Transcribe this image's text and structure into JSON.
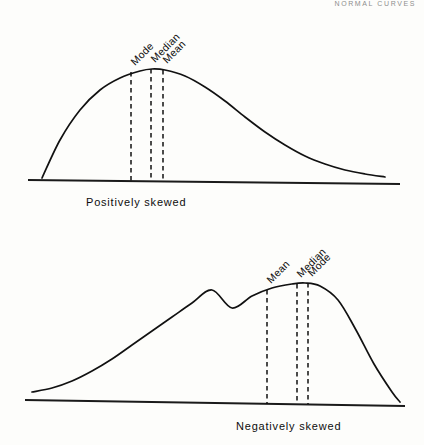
{
  "page": {
    "running_head": "NORMAL CURVES",
    "background_color": "#fdfdfb",
    "ink_color": "#111111"
  },
  "chart_data": {
    "type": "line",
    "panels": [
      {
        "id": "positively-skewed",
        "caption": "Positively skewed",
        "skew": "positive",
        "description": "Unimodal density curve with a long tail extending to the right; mode at the peak, median to its right, mean furthest right.",
        "baseline": {
          "x_start": 28,
          "x_end": 400,
          "y_start": 180,
          "y_end": 184
        },
        "curve_points": [
          [
            42,
            178
          ],
          [
            60,
            140
          ],
          [
            80,
            110
          ],
          [
            100,
            90
          ],
          [
            120,
            78
          ],
          [
            140,
            71
          ],
          [
            152,
            69
          ],
          [
            165,
            70
          ],
          [
            185,
            76
          ],
          [
            205,
            87
          ],
          [
            225,
            101
          ],
          [
            245,
            117
          ],
          [
            265,
            132
          ],
          [
            285,
            145
          ],
          [
            305,
            156
          ],
          [
            325,
            164
          ],
          [
            345,
            170
          ],
          [
            365,
            174
          ],
          [
            385,
            177
          ]
        ],
        "measures": [
          {
            "name": "Mode",
            "x": 131,
            "label_angle": -45,
            "line_top_y": 72,
            "line_bottom_y": 181
          },
          {
            "name": "Median",
            "x": 151,
            "label_angle": -45,
            "line_top_y": 69,
            "line_bottom_y": 181
          },
          {
            "name": "Mean",
            "x": 163,
            "label_angle": -45,
            "line_top_y": 70,
            "line_bottom_y": 181
          }
        ],
        "measure_order_left_to_right": [
          "Mode",
          "Median",
          "Mean"
        ]
      },
      {
        "id": "negatively-skewed",
        "caption": "Negatively skewed",
        "skew": "negative",
        "description": "Unimodal density curve with a long tail extending to the left; mean furthest left, then median, with mode at the peak.",
        "baseline": {
          "x_start": 25,
          "x_end": 405,
          "y_start": 400,
          "y_end": 406
        },
        "curve_points": [
          [
            32,
            392
          ],
          [
            52,
            388
          ],
          [
            72,
            381
          ],
          [
            92,
            371
          ],
          [
            112,
            359
          ],
          [
            132,
            345
          ],
          [
            152,
            331
          ],
          [
            172,
            317
          ],
          [
            192,
            303
          ],
          [
            212,
            290
          ],
          [
            232,
            308
          ],
          [
            252,
            296
          ],
          [
            272,
            288
          ],
          [
            292,
            284
          ],
          [
            305,
            283
          ],
          [
            320,
            286
          ],
          [
            338,
            300
          ],
          [
            356,
            330
          ],
          [
            374,
            364
          ],
          [
            392,
            392
          ],
          [
            400,
            402
          ]
        ],
        "measures": [
          {
            "name": "Mean",
            "x": 267,
            "label_angle": -45,
            "line_top_y": 290,
            "line_bottom_y": 404
          },
          {
            "name": "Median",
            "x": 297,
            "label_angle": -45,
            "line_top_y": 284,
            "line_bottom_y": 404
          },
          {
            "name": "Mode",
            "x": 308,
            "label_angle": -45,
            "line_top_y": 283,
            "line_bottom_y": 404
          }
        ],
        "measure_order_left_to_right": [
          "Mean",
          "Median",
          "Mode"
        ]
      }
    ],
    "xlabel": "",
    "ylabel": "",
    "grid": false,
    "legend": "none"
  }
}
